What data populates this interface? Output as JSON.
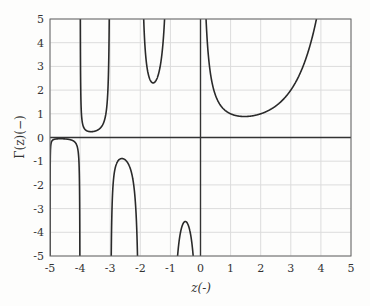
{
  "chart_data": {
    "type": "line",
    "title": "",
    "xlabel": "z(-)",
    "ylabel": "Γ(z)(−)",
    "xlim": [
      -5,
      5
    ],
    "ylim": [
      -5,
      5
    ],
    "grid": true,
    "legend": null,
    "x_ticks": [
      "-5",
      "-4",
      "-3",
      "-2",
      "-1",
      "0",
      "1",
      "2",
      "3",
      "4",
      "5"
    ],
    "y_ticks": [
      "-5",
      "-4",
      "-3",
      "-2",
      "-1",
      "0",
      "1",
      "2",
      "3",
      "4",
      "5"
    ],
    "function": "Gamma(z)",
    "poles": [
      0,
      -1,
      -2,
      -3,
      -4,
      -5
    ],
    "series": [
      {
        "name": "Γ(z)",
        "branches": [
          {
            "interval": [
              -5,
              -4
            ],
            "extremum": {
              "x": -4.65,
              "y": -0.03
            },
            "points": [
              [
                -4.99,
                -0.04
              ],
              [
                -4.9,
                -0.03
              ],
              [
                -4.65,
                -0.03
              ],
              [
                -4.3,
                -0.05
              ],
              [
                -4.1,
                -0.27
              ],
              [
                -4.02,
                -1.05
              ],
              [
                -4.005,
                -4.2
              ]
            ]
          },
          {
            "interval": [
              -4,
              -3
            ],
            "extremum": {
              "x": -3.64,
              "y": 0.25
            },
            "points": [
              [
                -3.995,
                5
              ],
              [
                -3.96,
                1.1
              ],
              [
                -3.9,
                0.47
              ],
              [
                -3.64,
                0.25
              ],
              [
                -3.3,
                0.37
              ],
              [
                -3.1,
                0.86
              ],
              [
                -3.03,
                2.6
              ],
              [
                -3.015,
                5
              ]
            ]
          },
          {
            "interval": [
              -3,
              -2
            ],
            "extremum": {
              "x": -2.61,
              "y": -0.89
            },
            "points": [
              [
                -2.97,
                -5
              ],
              [
                -2.9,
                -1.52
              ],
              [
                -2.8,
                -0.99
              ],
              [
                -2.61,
                -0.89
              ],
              [
                -2.4,
                -1.11
              ],
              [
                -2.2,
                -2.06
              ],
              [
                -2.1,
                -4.25
              ],
              [
                -2.085,
                -5
              ]
            ]
          },
          {
            "interval": [
              -2,
              -1
            ],
            "extremum": {
              "x": -1.5,
              "y": 2.36
            },
            "points": [
              [
                -1.93,
                5
              ],
              [
                -1.8,
                2.77
              ],
              [
                -1.5,
                2.36
              ],
              [
                -1.2,
                2.84
              ],
              [
                -1.1,
                4.85
              ],
              [
                -1.09,
                5
              ]
            ]
          },
          {
            "interval": [
              -1,
              0
            ],
            "extremum": {
              "x": -0.5,
              "y": -3.54
            },
            "points": [
              [
                -0.75,
                -5
              ],
              [
                -0.6,
                -3.7
              ],
              [
                -0.5,
                -3.54
              ],
              [
                -0.4,
                -3.72
              ],
              [
                -0.3,
                -4.33
              ],
              [
                -0.24,
                -5
              ]
            ]
          },
          {
            "interval": [
              0,
              5
            ],
            "extremum": {
              "x": 1.46,
              "y": 0.89
            },
            "points": [
              [
                0.2,
                4.59
              ],
              [
                0.5,
                1.77
              ],
              [
                1,
                1
              ],
              [
                1.46,
                0.89
              ],
              [
                2,
                1
              ],
              [
                2.5,
                1.33
              ],
              [
                3,
                2
              ],
              [
                3.5,
                3.32
              ],
              [
                3.84,
                5
              ]
            ]
          }
        ]
      }
    ]
  }
}
